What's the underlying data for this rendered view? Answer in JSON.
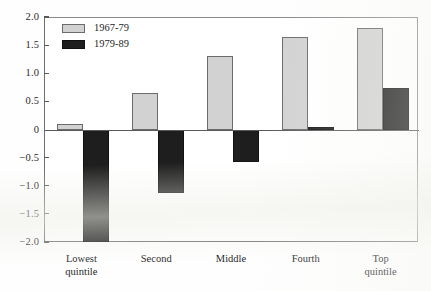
{
  "chart_data": {
    "type": "bar",
    "title": "",
    "subtitle": "",
    "xlabel": "",
    "ylabel": "",
    "ylim": [
      -2.0,
      2.0
    ],
    "grid": false,
    "legend_position": "upper-left-inside",
    "categories": [
      "Lowest quintile",
      "Second",
      "Middle",
      "Fourth",
      "Top quintile"
    ],
    "category_lines": [
      [
        "Lowest",
        "quintile"
      ],
      [
        "Second"
      ],
      [
        "Middle"
      ],
      [
        "Fourth"
      ],
      [
        "Top",
        "quintile"
      ]
    ],
    "y_tick_labels": [
      "2.0",
      "1.5",
      "1.0",
      "0.5",
      "0",
      "−0.5",
      "−1.0",
      "−1.5",
      "−2.0"
    ],
    "y_tick_values": [
      2.0,
      1.5,
      1.0,
      0.5,
      0,
      -0.5,
      -1.0,
      -1.5,
      -2.0
    ],
    "series": [
      {
        "name": "1967-79",
        "color": "#d2d2d2",
        "edge_color": "#6b6b6b",
        "values": [
          0.1,
          0.65,
          1.3,
          1.65,
          1.8
        ]
      },
      {
        "name": "1979-89",
        "color": "#1e1e1e",
        "edge_color": "#111111",
        "values": [
          -2.0,
          -1.13,
          -0.57,
          0.05,
          0.73
        ]
      }
    ],
    "annotations": []
  },
  "legend": {
    "entries": [
      {
        "label": "1967-79",
        "swatch": "light-gray-square"
      },
      {
        "label": "1979-89",
        "swatch": "black-square"
      }
    ]
  },
  "axes": {
    "zero_line_label": "0",
    "y_axis_name": "y-axis",
    "x_axis_name": "x-axis"
  }
}
